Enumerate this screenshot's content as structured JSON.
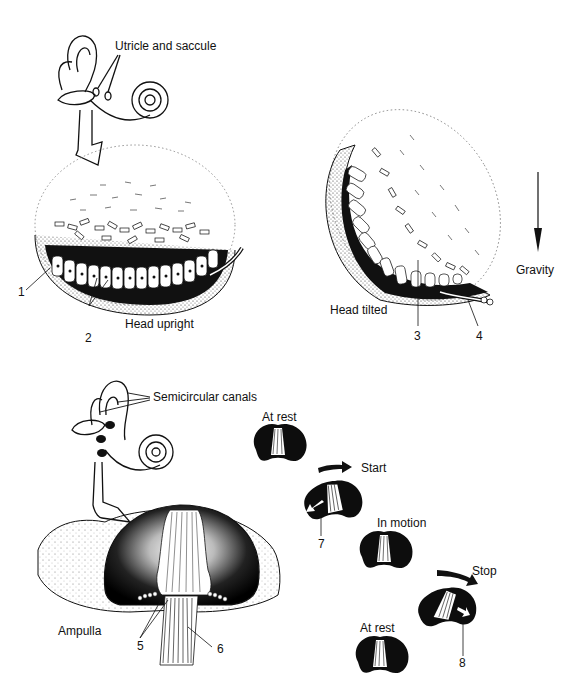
{
  "figure": {
    "panels": {
      "otolith": {
        "inner_ear_label": "Utricle and saccule",
        "upright_label": "Head upright",
        "tilted_label": "Head tilted",
        "gravity_label": "Gravity"
      },
      "canal": {
        "inner_ear_label": "Semicircular canals",
        "ampulla_label": "Ampulla",
        "sequence": [
          {
            "state": "At rest"
          },
          {
            "state": "Start"
          },
          {
            "state": "In motion"
          },
          {
            "state": "Stop"
          },
          {
            "state": "At rest"
          }
        ]
      }
    },
    "callouts": [
      "1",
      "2",
      "3",
      "4",
      "5",
      "6",
      "7",
      "8"
    ],
    "colors": {
      "ink": "#111111",
      "background": "#ffffff",
      "tissue_dark": "#0d0d0d"
    }
  }
}
